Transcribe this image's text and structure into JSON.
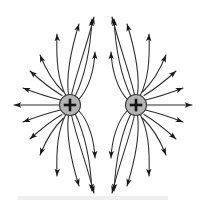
{
  "figure": {
    "title": "Electric field lines of two like positive point charges",
    "type": "physics-field-diagram",
    "width": 203,
    "height": 206,
    "background_color": "#ffffff",
    "line_color": "#2b2b2b",
    "arrow_color": "#1a1a1a",
    "charge_fill_color": "#b4b4b4",
    "charge_stroke_color": "#3a3a3a",
    "sign_color": "#111111"
  },
  "charges": [
    {
      "id": "left-charge",
      "label": "+",
      "polarity": "positive",
      "cx": 70,
      "cy": 105,
      "r": 10.5
    },
    {
      "id": "right-charge",
      "label": "+",
      "polarity": "positive",
      "cx": 136,
      "cy": 105,
      "r": 10.5
    }
  ],
  "field_lines": {
    "count_per_charge": 13,
    "direction": "outward",
    "arrowheads": "at outer tip of every line",
    "left": [
      {
        "id": "L-w",
        "d": "M 59.5 105 L 14 105",
        "tip": [
          14,
          105
        ],
        "angle": 180
      },
      {
        "id": "L-wnw",
        "d": "M 60.5 100 C 48 97 36 93 23 88",
        "tip": [
          23,
          88
        ],
        "angle": 200
      },
      {
        "id": "L-nw1",
        "d": "M 62 95.5 C 51 89 41 81 30 71",
        "tip": [
          30,
          71
        ],
        "angle": 222
      },
      {
        "id": "L-nw2",
        "d": "M 63.5 92 C 53 82 46 70 40 55",
        "tip": [
          40,
          55
        ],
        "angle": 248
      },
      {
        "id": "L-nnw",
        "d": "M 66 96 C 58 80 56 62 57 34",
        "tip": [
          57,
          34
        ],
        "angle": 268
      },
      {
        "id": "L-n1",
        "d": "M 68.5 95 C 66 76 70 53 79 24",
        "tip": [
          79,
          24
        ],
        "angle": 287
      },
      {
        "id": "L-n2",
        "d": "M 71.5 95 C 76 74 86 48 94 17",
        "tip": [
          94,
          17
        ],
        "angle": 285
      },
      {
        "id": "L-nne",
        "d": "M 75 96.5 C 83 80 90 58 92 19",
        "tip": [
          92,
          19
        ],
        "angle": 275
      },
      {
        "id": "L-ne",
        "d": "M 78.5 99.5 C 88 90 94 72 95 52",
        "tip": [
          95,
          52
        ],
        "angle": 272
      },
      {
        "id": "L-se",
        "d": "M 78.5 110.5 C 88 120 94 138 95 158",
        "tip": [
          95,
          158
        ],
        "angle": 88
      },
      {
        "id": "L-sse",
        "d": "M 75 113.5 C 83 130 90 152 92 191",
        "tip": [
          92,
          191
        ],
        "angle": 85
      },
      {
        "id": "L-s2",
        "d": "M 71.5 115 C 76 136 86 162 94 193",
        "tip": [
          94,
          193
        ],
        "angle": 75
      },
      {
        "id": "L-s1",
        "d": "M 68.5 115 C 66 134 70 157 79 186",
        "tip": [
          79,
          186
        ],
        "angle": 73
      },
      {
        "id": "L-ssw",
        "d": "M 66 114 C 58 130 56 148 57 176",
        "tip": [
          57,
          176
        ],
        "angle": 92
      },
      {
        "id": "L-sw2",
        "d": "M 63.5 118 C 53 128 46 140 40 155",
        "tip": [
          40,
          155
        ],
        "angle": 112
      },
      {
        "id": "L-sw1",
        "d": "M 62 114.5 C 51 121 41 129 30 139",
        "tip": [
          30,
          139
        ],
        "angle": 138
      },
      {
        "id": "L-wsw",
        "d": "M 60.5 110 C 48 113 36 117 23 122",
        "tip": [
          23,
          122
        ],
        "angle": 160
      }
    ],
    "right": [
      {
        "id": "R-e",
        "d": "M 146.5 105 L 192 105",
        "tip": [
          192,
          105
        ],
        "angle": 0
      },
      {
        "id": "R-ene",
        "d": "M 145.5 100 C 158 97 170 93 183 88",
        "tip": [
          183,
          88
        ],
        "angle": -20
      },
      {
        "id": "R-ne1",
        "d": "M 144 95.5 C 155 89 165 81 176 71",
        "tip": [
          176,
          71
        ],
        "angle": -42
      },
      {
        "id": "R-ne2",
        "d": "M 142.5 92 C 153 82 160 70 166 55",
        "tip": [
          166,
          55
        ],
        "angle": -68
      },
      {
        "id": "R-nne",
        "d": "M 140 96 C 148 80 150 62 149 34",
        "tip": [
          149,
          34
        ],
        "angle": -88
      },
      {
        "id": "R-n1",
        "d": "M 137.5 95 C 140 76 136 53 127 24",
        "tip": [
          127,
          24
        ],
        "angle": -107
      },
      {
        "id": "R-n2",
        "d": "M 134.5 95 C 130 74 120 48 112 17",
        "tip": [
          112,
          17
        ],
        "angle": -105
      },
      {
        "id": "R-nnw",
        "d": "M 131 96.5 C 123 80 116 58 114 19",
        "tip": [
          114,
          19
        ],
        "angle": -95
      },
      {
        "id": "R-nw",
        "d": "M 127.5 99.5 C 118 90 112 72 111 52",
        "tip": [
          111,
          52
        ],
        "angle": -92
      },
      {
        "id": "R-sw",
        "d": "M 127.5 110.5 C 118 120 112 138 111 158",
        "tip": [
          111,
          158
        ],
        "angle": 92
      },
      {
        "id": "R-ssw",
        "d": "M 131 113.5 C 123 130 116 152 114 191",
        "tip": [
          114,
          191
        ],
        "angle": 95
      },
      {
        "id": "R-s2",
        "d": "M 134.5 115 C 130 136 120 162 112 193",
        "tip": [
          112,
          193
        ],
        "angle": 105
      },
      {
        "id": "R-s1",
        "d": "M 137.5 115 C 140 134 136 157 127 186",
        "tip": [
          127,
          186
        ],
        "angle": 107
      },
      {
        "id": "R-sse",
        "d": "M 140 114 C 148 130 150 148 149 176",
        "tip": [
          149,
          176
        ],
        "angle": 88
      },
      {
        "id": "R-se2",
        "d": "M 142.5 118 C 153 128 160 140 166 155",
        "tip": [
          166,
          155
        ],
        "angle": 68
      },
      {
        "id": "R-se1",
        "d": "M 144 114.5 C 155 121 165 129 176 139",
        "tip": [
          176,
          139
        ],
        "angle": 42
      },
      {
        "id": "R-ese",
        "d": "M 145.5 110 C 158 113 170 117 183 122",
        "tip": [
          183,
          122
        ],
        "angle": 20
      }
    ]
  },
  "artifacts": [
    {
      "id": "scan-smudge-bottom",
      "x": 18,
      "y": 196,
      "width": 150,
      "height": 4,
      "color": "#efefef"
    }
  ]
}
